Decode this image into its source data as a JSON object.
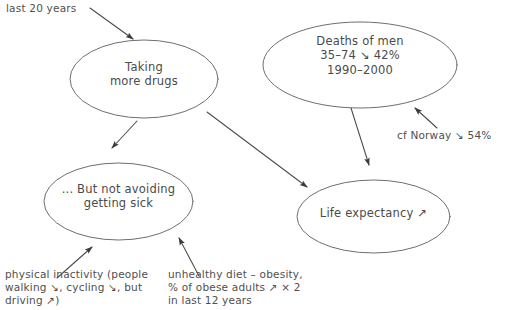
{
  "diagram": {
    "type": "hand-drawn-concept-map",
    "background_color": "#ffffff",
    "ink_color": "#4a4a4a",
    "nodes": [
      {
        "id": "taking-more-drugs",
        "label": "Taking\nmore drugs"
      },
      {
        "id": "deaths-of-men",
        "label": "Deaths of men\n35–74 ↘ 42%\n1990–2000"
      },
      {
        "id": "not-avoiding-sick",
        "label": "... But not avoiding\ngetting sick"
      },
      {
        "id": "life-expectancy",
        "label": "Life expectancy ↗"
      }
    ],
    "annotations": [
      {
        "id": "last-20-years",
        "text": "last 20 years"
      },
      {
        "id": "cf-norway",
        "text": "cf Norway ↘ 54%"
      },
      {
        "id": "physical-inactivity",
        "text": "physical inactivity (people\nwalking ↘, cycling ↘, but\ndriving ↗)"
      },
      {
        "id": "unhealthy-diet",
        "text": "unhealthy diet – obesity,\n% of obese adults ↗ × 2\nin last 12 years"
      }
    ]
  }
}
